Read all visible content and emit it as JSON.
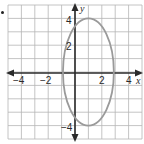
{
  "chart_data": {
    "type": "diagram",
    "title": "",
    "xlabel": "x",
    "ylabel": "y",
    "xlim": [
      -5,
      5
    ],
    "ylim": [
      -5,
      5
    ],
    "grid": true,
    "grid_step": 1,
    "x_tick_labels": [
      {
        "value": -4,
        "label": "−4"
      },
      {
        "value": -2,
        "label": "−2"
      },
      {
        "value": 2,
        "label": "2"
      },
      {
        "value": 4,
        "label": "4"
      }
    ],
    "y_tick_labels": [
      {
        "value": 4,
        "label": "4"
      },
      {
        "value": 2,
        "label": "2"
      },
      {
        "value": -4,
        "label": "−4"
      }
    ],
    "shapes": [
      {
        "type": "ellipse",
        "center": [
          1,
          0
        ],
        "semi_axis_x": 1.9,
        "semi_axis_y": 4,
        "stroke": "#9a9a9a"
      }
    ]
  },
  "colors": {
    "grid": "#b5b5b5",
    "axis": "#2a2a2a",
    "curve": "#9a9a9a",
    "text": "#2a2a2a"
  },
  "labels": {
    "x_axis": "x",
    "y_axis": "y",
    "x_m4": "−4",
    "x_m2": "−2",
    "x_2": "2",
    "x_4": "4",
    "y_4": "4",
    "y_2": "2",
    "y_m4": "−4"
  }
}
